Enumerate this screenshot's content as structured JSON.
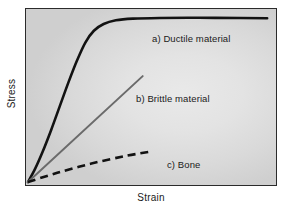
{
  "chart_data": {
    "type": "line",
    "title": "",
    "xlabel": "Strain",
    "ylabel": "Stress",
    "xlim": [
      0,
      1
    ],
    "ylim": [
      0,
      1
    ],
    "grid": false,
    "axis_ticks": false,
    "legend_position": "inline-annotations",
    "background": "#e3e3e3",
    "frame_color": "#2b2b2b",
    "series": [
      {
        "name": "a) Ductile material",
        "style": "solid",
        "color": "#121212",
        "width": 2.6,
        "points": [
          [
            0.0,
            0.0
          ],
          [
            0.028,
            0.075
          ],
          [
            0.06,
            0.18
          ],
          [
            0.095,
            0.31
          ],
          [
            0.13,
            0.45
          ],
          [
            0.165,
            0.59
          ],
          [
            0.2,
            0.72
          ],
          [
            0.235,
            0.83
          ],
          [
            0.27,
            0.9
          ],
          [
            0.31,
            0.94
          ],
          [
            0.36,
            0.962
          ],
          [
            0.43,
            0.972
          ],
          [
            0.54,
            0.976
          ],
          [
            0.7,
            0.977
          ],
          [
            0.87,
            0.976
          ],
          [
            0.98,
            0.974
          ]
        ]
      },
      {
        "name": "b) Brittle material",
        "style": "solid",
        "color": "#6b6b6b",
        "width": 2.0,
        "points": [
          [
            0.0,
            0.0
          ],
          [
            0.47,
            0.63
          ]
        ]
      },
      {
        "name": "c) Bone",
        "style": "dashed",
        "color": "#121212",
        "width": 2.6,
        "dash": "8 5",
        "points": [
          [
            0.0,
            0.0
          ],
          [
            0.12,
            0.055
          ],
          [
            0.26,
            0.11
          ],
          [
            0.4,
            0.155
          ],
          [
            0.51,
            0.183
          ]
        ]
      }
    ],
    "annotations": [
      {
        "text": "a) Ductile material",
        "series": "a) Ductile material"
      },
      {
        "text": "b) Brittle material",
        "series": "b) Brittle material"
      },
      {
        "text": "c) Bone",
        "series": "c) Bone"
      }
    ]
  },
  "labels": {
    "ductile": "a) Ductile material",
    "brittle": "b) Brittle material",
    "bone": "c) Bone",
    "x_axis": "Strain",
    "y_axis": "Stress"
  }
}
